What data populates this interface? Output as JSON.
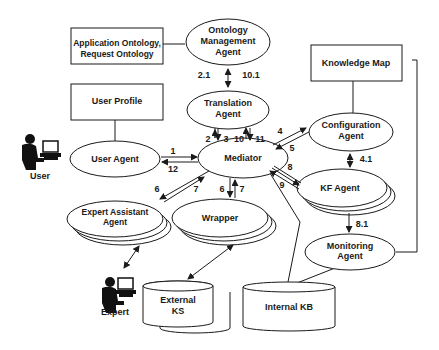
{
  "nodes": {
    "ontology_management_agent": {
      "lines": [
        "Ontology",
        "Management",
        "Agent"
      ]
    },
    "application_ontology": {
      "lines": [
        "Application Ontology,",
        "Request Ontology"
      ]
    },
    "user_profile": {
      "lines": [
        "User Profile"
      ]
    },
    "translation_agent": {
      "lines": [
        "Translation",
        "Agent"
      ]
    },
    "knowledge_map": {
      "lines": [
        "Knowledge Map"
      ]
    },
    "configuration_agent": {
      "lines": [
        "Configuration",
        "Agent"
      ]
    },
    "user_agent": {
      "lines": [
        "User Agent"
      ]
    },
    "mediator": {
      "lines": [
        "Mediator"
      ]
    },
    "kf_agent": {
      "lines": [
        "KF Agent"
      ]
    },
    "expert_assistant_agent": {
      "lines": [
        "Expert Assistant",
        "Agent"
      ]
    },
    "wrapper": {
      "lines": [
        "Wrapper"
      ]
    },
    "monitoring_agent": {
      "lines": [
        "Monitoring",
        "Agent"
      ]
    },
    "external_ks": {
      "lines": [
        "External",
        "KS"
      ]
    },
    "internal_kb": {
      "lines": [
        "Internal KB"
      ]
    }
  },
  "actors": {
    "user": {
      "label": "User"
    },
    "expert": {
      "label": "Expert"
    }
  },
  "edge_labels": {
    "e2_1": "2.1",
    "e10_1": "10.1",
    "e2": "2",
    "e3": "3",
    "e10": "10",
    "e11": "11",
    "e1": "1",
    "e12": "12",
    "e4": "4",
    "e5": "5",
    "e4_1": "4.1",
    "e8": "8",
    "e9": "9",
    "e6_left": "6",
    "e7_left": "7",
    "e6_down": "6",
    "e7_up": "7",
    "e8_1": "8.1"
  }
}
